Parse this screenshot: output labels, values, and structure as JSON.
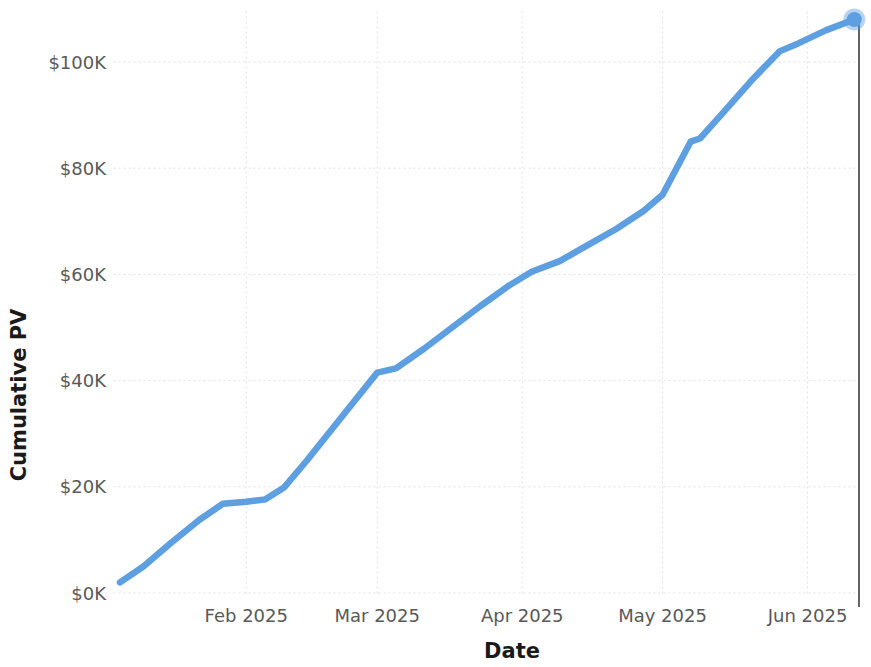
{
  "chart_data": {
    "type": "line",
    "title": "",
    "xlabel": "Date",
    "ylabel": "Cumulative PV",
    "grid": "dotted-both-axes",
    "legend": "none",
    "xtick_labels": [
      "Feb 2025",
      "Mar 2025",
      "Apr 2025",
      "May 2025",
      "Jun 2025"
    ],
    "ytick_labels": [
      "$0K",
      "$20K",
      "$40K",
      "$60K",
      "$80K",
      "$100K"
    ],
    "ytick_values": [
      0,
      20000,
      40000,
      60000,
      80000,
      100000
    ],
    "ylim": [
      0,
      112000
    ],
    "xlim": [
      "2025-01-05",
      "2025-06-12"
    ],
    "series": [
      {
        "name": "Cumulative PV",
        "color": "#5d9fe0",
        "marker_at_end": true,
        "end_value": 108000,
        "points": [
          {
            "x": "2025-01-05",
            "y": 2000
          },
          {
            "x": "2025-01-10",
            "y": 5000
          },
          {
            "x": "2025-01-16",
            "y": 9500
          },
          {
            "x": "2025-01-22",
            "y": 13800
          },
          {
            "x": "2025-01-27",
            "y": 16800
          },
          {
            "x": "2025-02-01",
            "y": 17200
          },
          {
            "x": "2025-02-05",
            "y": 17600
          },
          {
            "x": "2025-02-09",
            "y": 19800
          },
          {
            "x": "2025-02-14",
            "y": 25000
          },
          {
            "x": "2025-02-19",
            "y": 30500
          },
          {
            "x": "2025-02-24",
            "y": 36000
          },
          {
            "x": "2025-03-01",
            "y": 41500
          },
          {
            "x": "2025-03-05",
            "y": 42300
          },
          {
            "x": "2025-03-11",
            "y": 46000
          },
          {
            "x": "2025-03-17",
            "y": 50000
          },
          {
            "x": "2025-03-23",
            "y": 54000
          },
          {
            "x": "2025-03-29",
            "y": 57800
          },
          {
            "x": "2025-04-03",
            "y": 60500
          },
          {
            "x": "2025-04-09",
            "y": 62500
          },
          {
            "x": "2025-04-15",
            "y": 65500
          },
          {
            "x": "2025-04-21",
            "y": 68500
          },
          {
            "x": "2025-04-27",
            "y": 72000
          },
          {
            "x": "2025-05-01",
            "y": 75000
          },
          {
            "x": "2025-05-04",
            "y": 80000
          },
          {
            "x": "2025-05-07",
            "y": 85000
          },
          {
            "x": "2025-05-09",
            "y": 85600
          },
          {
            "x": "2025-05-14",
            "y": 90500
          },
          {
            "x": "2025-05-20",
            "y": 96500
          },
          {
            "x": "2025-05-26",
            "y": 102000
          },
          {
            "x": "2025-05-30",
            "y": 103500
          },
          {
            "x": "2025-06-05",
            "y": 106000
          },
          {
            "x": "2025-06-11",
            "y": 108000
          }
        ]
      }
    ],
    "annotations": [
      {
        "name": "today-marker",
        "type": "vertical-line",
        "x": "2025-06-12",
        "color": "#3d3d3d"
      }
    ]
  },
  "axes": {
    "x_title": "Date",
    "y_title": "Cumulative PV"
  },
  "colors": {
    "series": "#5d9fe0",
    "grid": "#c8c8c8",
    "tick_text": "#595959",
    "axis_title": "#1a1a1a",
    "marker_line": "#3d3d3d",
    "background": "#ffffff"
  }
}
